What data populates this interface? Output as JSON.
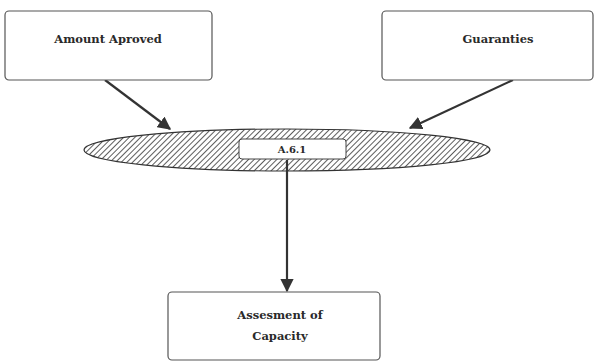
{
  "diagram": {
    "nodes": {
      "amount_approved": {
        "label": "Amount Aproved"
      },
      "guaranties": {
        "label": "Guaranties"
      },
      "process": {
        "label": "A.6.1"
      },
      "assessment": {
        "line1": "Assesment of",
        "line2": "Capacity"
      }
    },
    "edges": [
      {
        "from": "Amount Aproved",
        "to": "A.6.1"
      },
      {
        "from": "Guaranties",
        "to": "A.6.1"
      },
      {
        "from": "A.6.1",
        "to": "Assesment of Capacity"
      }
    ],
    "colors": {
      "stroke": "#333333",
      "background": "#ffffff"
    }
  }
}
